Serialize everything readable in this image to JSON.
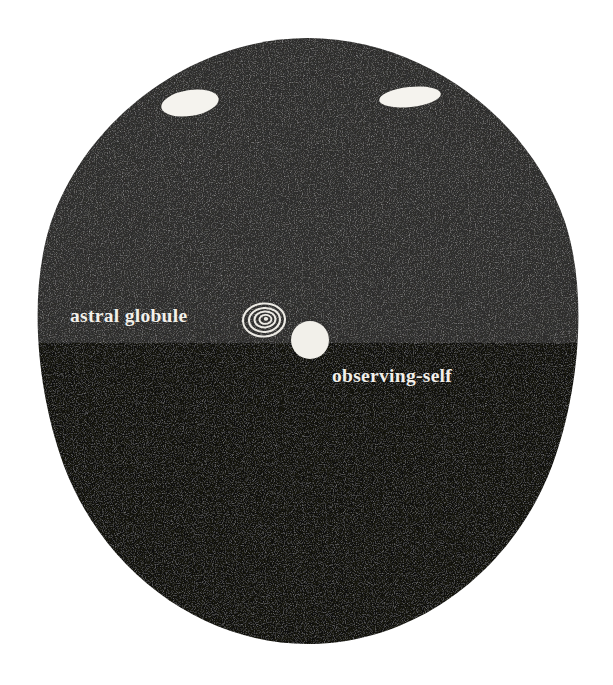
{
  "figure": {
    "name": "astral-globule-diagram",
    "background_color": "#ffffff",
    "shape": {
      "name": "egg-oval-body",
      "center_x": 308,
      "center_y": 341,
      "radius_x": 272,
      "radius_y": 303,
      "top_edge_y": 38,
      "bottom_edge_y": 644,
      "left_edge_x": 36,
      "right_edge_x": 580
    },
    "regions": [
      {
        "name": "upper-gray-hemisphere",
        "label": "upper region",
        "color": "#2f2e2d",
        "from_y": 38,
        "to_y": 343
      },
      {
        "name": "lower-black-hemisphere",
        "label": "lower region",
        "color": "#121211",
        "from_y": 343,
        "to_y": 644
      }
    ],
    "divider": {
      "name": "horizontal-boundary",
      "y": 343,
      "color": "#121211"
    }
  },
  "labels": {
    "astral_globule": {
      "text": "astral globule",
      "x": 70,
      "y": 322,
      "color": "#f2f0ea",
      "font_size": 19.5
    },
    "observing_self": {
      "text": "observing-self",
      "x": 332,
      "y": 382,
      "color": "#f2f0ea",
      "font_size": 19.5
    }
  },
  "marks": [
    {
      "name": "aperture-ellipse-left",
      "type": "ellipse",
      "cx": 190,
      "cy": 103,
      "rx": 29,
      "ry": 13,
      "rotation": -9,
      "color": "#f5f3ee"
    },
    {
      "name": "aperture-ellipse-right",
      "type": "ellipse",
      "cx": 410,
      "cy": 97,
      "rx": 31,
      "ry": 10,
      "rotation": -6,
      "color": "#f5f3ee"
    },
    {
      "name": "astral-globule-spiral",
      "type": "concentric-rings",
      "cx": 264,
      "cy": 320,
      "rx": 21,
      "ry": 16,
      "ring_count": 4,
      "color": "#eceae4"
    },
    {
      "name": "observing-self-disc",
      "type": "circle",
      "cx": 310,
      "cy": 340,
      "r": 19,
      "color": "#f2f0ea"
    }
  ],
  "colors": {
    "paper": "#ffffff",
    "upper_field": "#2f2e2d",
    "lower_field": "#121211",
    "ink_light": "#f2f0ea"
  }
}
